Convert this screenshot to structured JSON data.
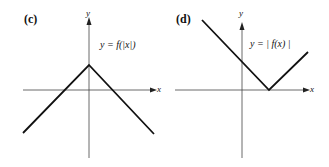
{
  "panels": [
    {
      "label": "(c)",
      "equation": "y = f(|x|)",
      "x_axis_label": "x",
      "y_axis_label": "y"
    },
    {
      "label": "(d)",
      "equation": "y = | f(x) |",
      "x_axis_label": "x",
      "y_axis_label": "y"
    }
  ],
  "colors": {
    "line": "#111111",
    "axis": "#444444",
    "background": "#ffffff"
  }
}
